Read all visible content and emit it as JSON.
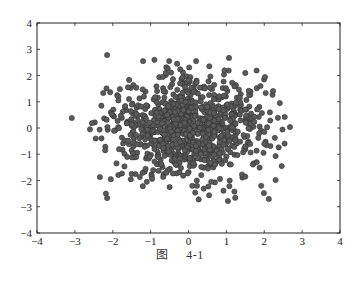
{
  "caption": {
    "prefix": "图",
    "number": "4-1"
  },
  "style": {
    "point_fill": "#5a5a5a",
    "point_stroke": "#333333",
    "axis_color": "#222222",
    "point_radius": 2.6
  },
  "chart_data": {
    "type": "scatter",
    "title": "",
    "xlabel": "",
    "ylabel": "",
    "xlim": [
      -4,
      4
    ],
    "ylim": [
      -4,
      4
    ],
    "xticks": [
      -4,
      -3,
      -2,
      -1,
      0,
      1,
      2,
      3,
      4
    ],
    "yticks": [
      -4,
      -3,
      -2,
      -1,
      0,
      1,
      2,
      3,
      4
    ],
    "grid": false,
    "legend": null,
    "series": [
      {
        "name": "samples",
        "points": [
          [
            -2.15,
            2.78
          ],
          [
            1.07,
            2.67
          ],
          [
            -3.08,
            0.38
          ],
          [
            -2.34,
            -1.87
          ],
          [
            -2.18,
            -2.5
          ],
          [
            -2.15,
            -2.67
          ],
          [
            1.04,
            -2.78
          ],
          [
            1.99,
            -2.48
          ],
          [
            2.12,
            -2.7
          ],
          [
            2.3,
            -1.07
          ],
          [
            2.46,
            -1.45
          ],
          [
            2.3,
            -1.98
          ],
          [
            2.02,
            1.94
          ],
          [
            2.23,
            1.41
          ],
          [
            2.41,
            0.95
          ],
          [
            2.54,
            0.42
          ],
          [
            2.68,
            0.04
          ],
          [
            -1.2,
            2.55
          ],
          [
            -0.9,
            2.6
          ],
          [
            -0.3,
            2.45
          ],
          [
            0.2,
            2.55
          ],
          [
            0.55,
            2.35
          ],
          [
            -1.6,
            1.55
          ],
          [
            -1.85,
            1.2
          ],
          [
            -1.85,
            1.05
          ],
          [
            -2.3,
            0.85
          ],
          [
            -2.6,
            -0.05
          ],
          [
            -2.45,
            -0.4
          ],
          [
            -2.2,
            -0.85
          ],
          [
            -1.9,
            -1.35
          ],
          [
            -1.5,
            -1.75
          ],
          [
            -1.1,
            -2.05
          ],
          [
            -0.5,
            -2.25
          ],
          [
            0.1,
            -2.2
          ],
          [
            0.6,
            -2.05
          ],
          [
            1.5,
            -1.85
          ],
          [
            1.8,
            -1.3
          ],
          [
            2.0,
            -0.6
          ],
          [
            2.15,
            0.6
          ],
          [
            1.9,
            1.6
          ],
          [
            1.5,
            2.1
          ],
          [
            0.95,
            2.2
          ],
          [
            -0.6,
            2.1
          ]
        ],
        "generated_core": {
          "count": 960,
          "mean": [
            0,
            0
          ],
          "std": [
            0.95,
            0.95
          ],
          "seed": 41
        }
      }
    ]
  }
}
